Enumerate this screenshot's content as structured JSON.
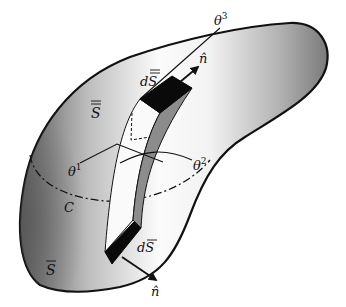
{
  "figure": {
    "colors": {
      "outline": "#111111",
      "surface_light": "#f7f7f7",
      "surface_dark": "#6a6a6a",
      "element_face": "#0a0a0a",
      "element_side": "#8c8c8c"
    }
  },
  "labels": {
    "theta3": "θ",
    "theta3_sup": "3",
    "theta1": "θ",
    "theta1_sup": "1",
    "theta2": "θ",
    "theta2_sup": "2",
    "n_top": "n̂",
    "n_bottom": "n̂",
    "dS_top": "dS",
    "dS_bottom": "dS",
    "S_top": "S",
    "S_bottom": "S",
    "curve_C": "C"
  }
}
